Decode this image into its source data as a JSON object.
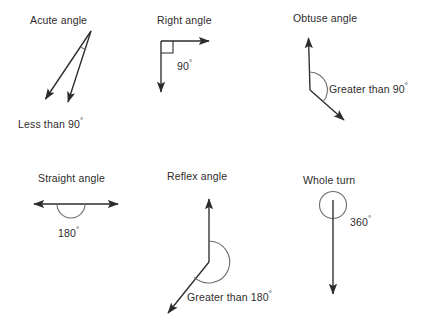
{
  "page": {
    "background": "#ffffff",
    "ink_color": "#2e2b2c",
    "arc_color": "#6f6c6d",
    "width": 432,
    "height": 326
  },
  "figures": [
    {
      "id": "acute-angle",
      "title": "Acute angle",
      "caption": "Less than 90",
      "degree_symbol": "°",
      "measure_text": "Less than 90°",
      "angle_type": "acute",
      "marker": "arc"
    },
    {
      "id": "right-angle",
      "title": "Right angle",
      "caption": "90",
      "degree_symbol": "°",
      "measure_text": "90°",
      "angle_type": "right",
      "marker": "square"
    },
    {
      "id": "obtuse-angle",
      "title": "Obtuse angle",
      "caption": "Greater than 90",
      "degree_symbol": "°",
      "measure_text": "Greater than 90°",
      "angle_type": "obtuse",
      "marker": "arc"
    },
    {
      "id": "straight-angle",
      "title": "Straight angle",
      "caption": "180",
      "degree_symbol": "°",
      "measure_text": "180°",
      "angle_type": "straight",
      "marker": "semicircle"
    },
    {
      "id": "reflex-angle",
      "title": "Reflex angle",
      "caption": "Greater than 180",
      "degree_symbol": "°",
      "measure_text": "Greater than 180°",
      "angle_type": "reflex",
      "marker": "arc"
    },
    {
      "id": "whole-turn",
      "title": "Whole turn",
      "caption": "360",
      "degree_symbol": "°",
      "measure_text": "360°",
      "angle_type": "full",
      "marker": "circle"
    }
  ]
}
